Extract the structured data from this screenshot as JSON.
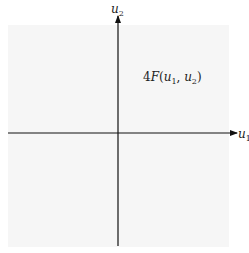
{
  "diagram": {
    "type": "coordinate-axes",
    "x_axis": {
      "label_main": "u",
      "label_sub": "1"
    },
    "y_axis": {
      "label_main": "u",
      "label_sub": "2"
    },
    "region_label": {
      "coef": "4",
      "func": "F",
      "open": "(",
      "arg1_main": "u",
      "arg1_sub": "1",
      "sep": ", ",
      "arg2_main": "u",
      "arg2_sub": "2",
      "close": ")"
    },
    "colors": {
      "axis": "#111111",
      "background_tint": "#f6f6f6"
    }
  }
}
